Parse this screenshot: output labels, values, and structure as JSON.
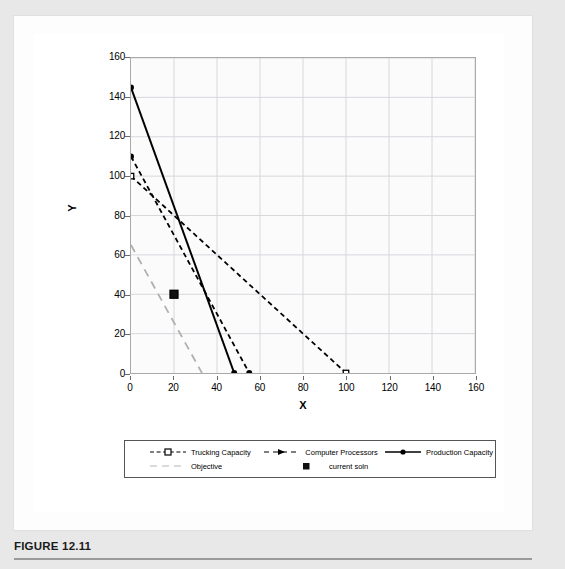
{
  "figure": {
    "caption_label": "FIGURE 12.11"
  },
  "chart_data": {
    "type": "line",
    "title": "",
    "xlabel": "X",
    "ylabel": "Y",
    "xlim": [
      0,
      160
    ],
    "ylim": [
      0,
      160
    ],
    "xticks": [
      0,
      20,
      40,
      60,
      80,
      100,
      120,
      140,
      160
    ],
    "yticks": [
      0,
      20,
      40,
      60,
      80,
      100,
      120,
      140,
      160
    ],
    "grid": true,
    "legend_position": "bottom",
    "series": [
      {
        "name": "Trucking Capacity",
        "style": "dashed",
        "marker": "square",
        "color": "#000000",
        "points": [
          [
            0,
            100
          ],
          [
            100,
            0
          ]
        ]
      },
      {
        "name": "Computer Processors",
        "style": "dashed",
        "marker": "triangle",
        "color": "#000000",
        "points": [
          [
            0,
            110
          ],
          [
            55,
            0
          ]
        ]
      },
      {
        "name": "Production Capacity",
        "style": "solid",
        "marker": "circle",
        "color": "#000000",
        "points": [
          [
            0,
            145
          ],
          [
            48,
            0
          ]
        ]
      },
      {
        "name": "Objective",
        "style": "long-dashed",
        "marker": "none",
        "color": "#b0b0b0",
        "points": [
          [
            0,
            65
          ],
          [
            33,
            0
          ]
        ]
      },
      {
        "name": "current soln",
        "style": "none",
        "marker": "square",
        "color": "#000000",
        "points": [
          [
            20,
            40
          ]
        ]
      }
    ]
  },
  "legend": {
    "entries": [
      {
        "label": "Trucking Capacity",
        "key": "dashed-square-key-icon"
      },
      {
        "label": "Computer Processors",
        "key": "dashed-triangle-key-icon"
      },
      {
        "label": "Production Capacity",
        "key": "solid-circle-key-icon"
      },
      {
        "label": "Objective",
        "key": "long-dashed-key-icon"
      },
      {
        "label": "current soln",
        "key": "square-marker-key-icon"
      }
    ]
  }
}
